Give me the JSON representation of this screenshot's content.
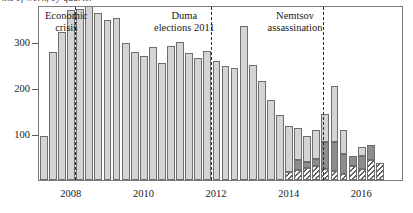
{
  "chart_data": {
    "type": "bar",
    "title": "...s of work, by quarter",
    "xlabel": "",
    "ylabel": "",
    "ylim": [
      0,
      380
    ],
    "yticks": [
      100,
      200,
      300
    ],
    "ytick_labels": [
      "100",
      "200",
      "300"
    ],
    "xtick_labels": [
      "2008",
      "2010",
      "2012",
      "2014",
      "2016"
    ],
    "xtick_positions": [
      2008.0,
      2010.0,
      2012.0,
      2014.0,
      2016.0
    ],
    "grid": false,
    "legend": "none",
    "stacked": true,
    "x_start": 2007.25,
    "quarter_step": 0.25,
    "categories": [
      "2007 Q2",
      "2007 Q3",
      "2007 Q4",
      "2008 Q1",
      "2008 Q2",
      "2008 Q3",
      "2008 Q4",
      "2009 Q1",
      "2009 Q2",
      "2009 Q3",
      "2009 Q4",
      "2010 Q1",
      "2010 Q2",
      "2010 Q3",
      "2010 Q4",
      "2011 Q1",
      "2011 Q2",
      "2011 Q3",
      "2011 Q4",
      "2012 Q1",
      "2012 Q2",
      "2012 Q3",
      "2012 Q4",
      "2013 Q1",
      "2013 Q2",
      "2013 Q3",
      "2013 Q4",
      "2014 Q1",
      "2014 Q2",
      "2014 Q3",
      "2014 Q4",
      "2015 Q1",
      "2015 Q2",
      "2015 Q3",
      "2015 Q4",
      "2016 Q1",
      "2016 Q2",
      "2016 Q3"
    ],
    "series": [
      {
        "name": "light-gray",
        "color": "#d4d4d4",
        "pattern": "solid",
        "values": [
          95,
          278,
          322,
          370,
          372,
          378,
          363,
          347,
          352,
          297,
          278,
          270,
          288,
          255,
          290,
          300,
          275,
          265,
          280,
          258,
          248,
          243,
          335,
          250,
          215,
          173,
          142,
          100,
          68,
          55,
          62,
          62,
          122,
          52,
          0,
          20,
          0,
          0
        ]
      },
      {
        "name": "dark-gray",
        "color": "#8d8d8d",
        "pattern": "solid",
        "values": [
          0,
          0,
          0,
          0,
          0,
          0,
          0,
          0,
          0,
          0,
          0,
          0,
          0,
          0,
          0,
          0,
          0,
          0,
          0,
          0,
          0,
          0,
          0,
          0,
          0,
          0,
          0,
          0,
          22,
          14,
          16,
          58,
          62,
          45,
          22,
          28,
          32,
          0
        ]
      },
      {
        "name": "hatched",
        "color": "#ffffff",
        "pattern": "diagonal-hatch",
        "values": [
          0,
          0,
          0,
          0,
          0,
          0,
          0,
          0,
          0,
          0,
          0,
          0,
          0,
          0,
          0,
          0,
          0,
          0,
          0,
          0,
          0,
          0,
          0,
          0,
          0,
          0,
          0,
          18,
          22,
          26,
          30,
          24,
          20,
          12,
          30,
          24,
          44,
          38
        ]
      }
    ],
    "annotations": [
      {
        "label": "Economic\ncrisis",
        "x": 2008.2,
        "label_x": 2008.0
      },
      {
        "label": "Duma\nelections 2011",
        "x": 2011.95,
        "label_x": 2011.25
      },
      {
        "label": "Nemtsov\nassassination",
        "x": 2015.05,
        "label_x": 2014.3
      }
    ]
  }
}
